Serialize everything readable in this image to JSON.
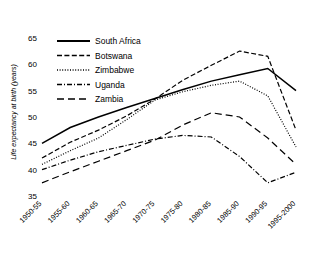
{
  "chart_data": {
    "type": "line",
    "title": "",
    "xlabel": "",
    "ylabel": "Life expectancy at birth (years)",
    "ylim": [
      35,
      66.5
    ],
    "yticks": [
      35,
      40,
      45,
      50,
      55,
      60,
      65
    ],
    "grid": false,
    "legend_position": "upper-left-inside",
    "categories": [
      "1950-55",
      "1955-60",
      "1960-65",
      "1965-70",
      "1970-75",
      "1975-80",
      "1980-85",
      "1985-90",
      "1990-95",
      "1995-2000"
    ],
    "series": [
      {
        "name": "South Africa",
        "style": "solid",
        "values": [
          45.0,
          48.0,
          50.0,
          51.8,
          53.5,
          55.2,
          56.8,
          58.0,
          59.2,
          55.0
        ]
      },
      {
        "name": "Botswana",
        "style": "dashed",
        "values": [
          42.2,
          45.2,
          47.5,
          50.2,
          53.4,
          57.0,
          59.8,
          62.5,
          61.5,
          47.5
        ]
      },
      {
        "name": "Zimbabwe",
        "style": "dotted",
        "values": [
          41.0,
          43.6,
          46.0,
          49.5,
          53.2,
          54.8,
          56.0,
          56.8,
          54.0,
          44.3
        ]
      },
      {
        "name": "Uganda",
        "style": "dash-dot",
        "values": [
          40.0,
          41.8,
          43.4,
          44.6,
          45.8,
          46.5,
          46.2,
          42.5,
          37.5,
          39.5
        ]
      },
      {
        "name": "Zambia",
        "style": "long-dash",
        "values": [
          37.5,
          39.6,
          41.6,
          43.6,
          45.6,
          48.5,
          50.8,
          50.0,
          46.0,
          41.0
        ]
      }
    ]
  },
  "legend": {
    "entries": [
      {
        "label": "South Africa"
      },
      {
        "label": "Botswana"
      },
      {
        "label": "Zimbabwe"
      },
      {
        "label": "Uganda"
      },
      {
        "label": "Zambia"
      }
    ]
  },
  "caption": {
    "text": ""
  }
}
